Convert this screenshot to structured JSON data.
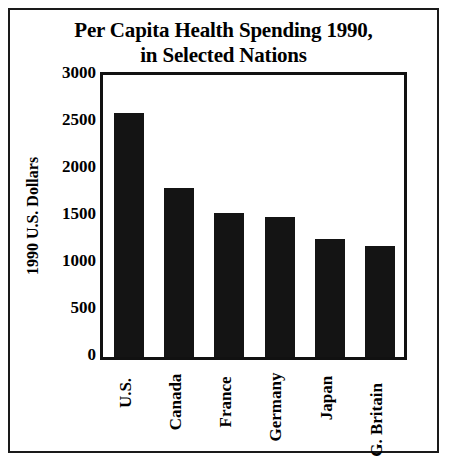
{
  "chart_data": {
    "type": "bar",
    "title": "Per Capita Health Spending 1990, in Selected Nations",
    "title_lines": [
      "Per Capita Health Spending 1990,",
      "in Selected Nations"
    ],
    "categories": [
      "U.S.",
      "Canada",
      "France",
      "Germany",
      "Japan",
      "G. Britain"
    ],
    "values": [
      2600,
      1800,
      1530,
      1490,
      1260,
      1180
    ],
    "series": [
      {
        "name": "1990 U.S. Dollars",
        "values": [
          2600,
          1800,
          1530,
          1490,
          1260,
          1180
        ]
      }
    ],
    "xlabel": "",
    "ylabel": "1990 U.S. Dollars",
    "ylim": [
      0,
      3000
    ],
    "y_ticks": [
      0,
      500,
      1000,
      1500,
      2000,
      2500,
      3000
    ],
    "y_tick_labels": [
      "0",
      "500",
      "1000",
      "1500",
      "2000",
      "2500",
      "3000"
    ],
    "grid": false,
    "legend": false,
    "legend_position": "none",
    "bar_color": "#141414",
    "background_color": "#ffffff",
    "axis_color": "#111111",
    "text_color": "#000000"
  }
}
